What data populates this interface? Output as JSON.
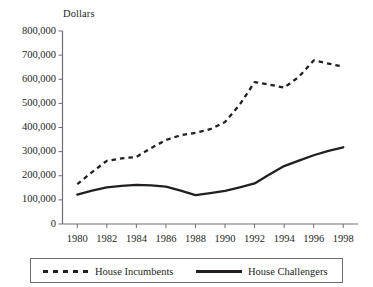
{
  "chart_data": {
    "type": "line",
    "title": "",
    "ylabel": "Dollars",
    "xlabel": "",
    "ylim": [
      0,
      800000
    ],
    "xlim": [
      1979,
      1999
    ],
    "grid": false,
    "legend_position": "bottom",
    "ytick_labels": [
      "800,000",
      "700,000",
      "600,000",
      "500,000",
      "400,000",
      "300,000",
      "200,000",
      "100,000",
      "0"
    ],
    "ytick_values": [
      800000,
      700000,
      600000,
      500000,
      400000,
      300000,
      200000,
      100000,
      0
    ],
    "categories": [
      1980,
      1981,
      1982,
      1983,
      1984,
      1985,
      1986,
      1987,
      1988,
      1989,
      1990,
      1991,
      1992,
      1993,
      1994,
      1995,
      1996,
      1997,
      1998
    ],
    "xtick_labels": [
      "1980",
      "1982",
      "1984",
      "1986",
      "1988",
      "1990",
      "1992",
      "1994",
      "1996",
      "1998"
    ],
    "xtick_values": [
      1980,
      1982,
      1984,
      1986,
      1988,
      1990,
      1992,
      1994,
      1996,
      1998
    ],
    "series": [
      {
        "name": "House Incumbents",
        "style": "dashed",
        "color": "#231f20",
        "values": [
          165000,
          215000,
          262000,
          272000,
          278000,
          315000,
          348000,
          368000,
          378000,
          393000,
          423000,
          495000,
          588000,
          578000,
          565000,
          610000,
          678000,
          665000,
          652000
        ]
      },
      {
        "name": "House Challengers",
        "style": "solid",
        "color": "#231f20",
        "values": [
          122000,
          138000,
          152000,
          158000,
          162000,
          160000,
          155000,
          138000,
          120000,
          128000,
          137000,
          152000,
          168000,
          205000,
          240000,
          263000,
          285000,
          303000,
          318000
        ]
      }
    ]
  },
  "legend": {
    "entries": [
      {
        "label": "House Incumbents",
        "style": "dashed"
      },
      {
        "label": "House Challengers",
        "style": "solid"
      }
    ]
  }
}
